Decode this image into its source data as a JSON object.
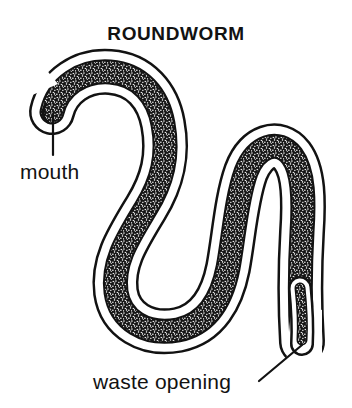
{
  "figure": {
    "title": "ROUNDWORM",
    "subject": "roundworm",
    "style": "black-and-white line drawing",
    "background_color": "#ffffff",
    "ink_color": "#121212",
    "gut_fill_color": "#2b2b2b",
    "cuticle_fill_color": "#ffffff",
    "labels": [
      {
        "id": "mouth",
        "text": "mouth",
        "text_x": 20,
        "text_y": 179,
        "leader": {
          "from_x": 53,
          "from_y": 155,
          "to_x": 53,
          "to_y": 114
        }
      },
      {
        "id": "waste-opening",
        "text": "waste opening",
        "text_x": 93,
        "text_y": 389,
        "leader": {
          "from_x": 259,
          "from_y": 381,
          "to_x": 302,
          "to_y": 345
        }
      }
    ],
    "anatomy": {
      "mouth_tip": {
        "x": 50,
        "y": 112
      },
      "tail_tip": {
        "x": 302,
        "y": 344
      },
      "body_shape": "S-curve with two loops"
    }
  }
}
